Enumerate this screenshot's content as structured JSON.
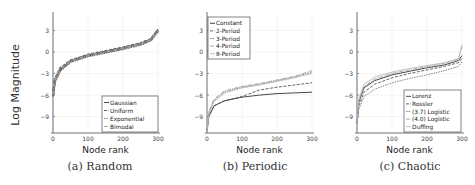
{
  "figure": {
    "ylabel": "Log Magnitude",
    "captions": [
      "(a) Random",
      "(b) Periodic",
      "(c) Chaotic"
    ]
  },
  "chart_data": [
    {
      "type": "line",
      "title": "(a) Random",
      "xlabel": "Node rank",
      "ylabel": "Log Magnitude",
      "xlim": [
        0,
        300
      ],
      "ylim": [
        -11,
        5
      ],
      "xticks": [
        0,
        100,
        200,
        300
      ],
      "yticks": [
        3,
        0,
        -3,
        -6,
        -9
      ],
      "grid": true,
      "legend_position": "lower right",
      "series": [
        {
          "name": "Gaussian",
          "x": [
            0,
            5,
            20,
            50,
            100,
            150,
            200,
            250,
            280,
            300
          ],
          "values": [
            -6,
            -4,
            -2.5,
            -1.3,
            -0.5,
            0,
            0.5,
            1.1,
            1.7,
            3
          ]
        },
        {
          "name": "Uniform",
          "x": [
            0,
            5,
            20,
            50,
            100,
            150,
            200,
            250,
            280,
            300
          ],
          "values": [
            -6,
            -3.8,
            -2.3,
            -1.2,
            -0.4,
            0.1,
            0.6,
            1.2,
            1.8,
            3.1
          ]
        },
        {
          "name": "Exponential",
          "x": [
            0,
            5,
            20,
            50,
            100,
            150,
            200,
            250,
            280,
            300
          ],
          "values": [
            -6.2,
            -4.2,
            -2.6,
            -1.4,
            -0.6,
            -0.1,
            0.4,
            1.0,
            1.6,
            2.9
          ]
        },
        {
          "name": "Bimodal",
          "x": [
            0,
            5,
            20,
            50,
            100,
            150,
            200,
            250,
            280,
            300
          ],
          "values": [
            -5.9,
            -3.9,
            -2.4,
            -1.3,
            -0.5,
            0,
            0.5,
            1.1,
            1.7,
            3
          ]
        }
      ]
    },
    {
      "type": "line",
      "title": "(b) Periodic",
      "xlabel": "Node rank",
      "ylabel": "Log Magnitude",
      "xlim": [
        0,
        300
      ],
      "ylim": [
        -11,
        5
      ],
      "xticks": [
        0,
        100,
        200,
        300
      ],
      "yticks": [
        3,
        0,
        -3,
        -6,
        -9
      ],
      "grid": true,
      "legend_position": "upper left",
      "series": [
        {
          "name": "Constant",
          "x": [
            0,
            5,
            20,
            50,
            100,
            150,
            200,
            250,
            300
          ],
          "values": [
            -11,
            -9,
            -7.5,
            -6.8,
            -6.3,
            -6,
            -5.8,
            -5.7,
            -5.6
          ]
        },
        {
          "name": "2-Period",
          "x": [
            0,
            5,
            20,
            50,
            100,
            150,
            200,
            250,
            300
          ],
          "values": [
            -11,
            -9,
            -7.5,
            -6.8,
            -6.2,
            -5.3,
            -4.9,
            -4.6,
            -4.3
          ]
        },
        {
          "name": "3-Period",
          "x": [
            0,
            5,
            20,
            50,
            100,
            150,
            200,
            250,
            300
          ],
          "values": [
            -11,
            -8.5,
            -6.8,
            -5.6,
            -4.9,
            -4.5,
            -4.0,
            -3.5,
            -2.8
          ]
        },
        {
          "name": "4-Period",
          "x": [
            0,
            5,
            20,
            50,
            100,
            150,
            200,
            250,
            300
          ],
          "values": [
            -11,
            -8.3,
            -6.6,
            -5.4,
            -4.8,
            -4.4,
            -3.9,
            -3.4,
            -2.6
          ]
        },
        {
          "name": "8-Period",
          "x": [
            0,
            5,
            20,
            50,
            100,
            150,
            200,
            250,
            300
          ],
          "values": [
            -11,
            -8.6,
            -6.9,
            -5.7,
            -5.0,
            -4.6,
            -4.1,
            -3.6,
            -3.0
          ]
        }
      ]
    },
    {
      "type": "line",
      "title": "(c) Chaotic",
      "xlabel": "Node rank",
      "ylabel": "Log Magnitude",
      "xlim": [
        0,
        300
      ],
      "ylim": [
        -11,
        5
      ],
      "xticks": [
        0,
        100,
        200,
        300
      ],
      "yticks": [
        3,
        0,
        -3,
        -6,
        -9
      ],
      "grid": true,
      "legend_position": "lower right",
      "series": [
        {
          "name": "Lorenz",
          "x": [
            0,
            5,
            20,
            50,
            100,
            150,
            200,
            250,
            290,
            300
          ],
          "values": [
            -10,
            -7,
            -5,
            -4,
            -3.2,
            -2.7,
            -2.2,
            -1.8,
            -1.2,
            -0.5
          ]
        },
        {
          "name": "Rossler",
          "x": [
            0,
            5,
            20,
            50,
            100,
            150,
            200,
            250,
            290,
            300
          ],
          "values": [
            -10,
            -7.5,
            -5.6,
            -4.5,
            -3.6,
            -3.0,
            -2.5,
            -2.0,
            -1.5,
            -0.9
          ]
        },
        {
          "name": "(3.7) Logistic",
          "x": [
            0,
            5,
            20,
            50,
            100,
            150,
            200,
            250,
            290,
            300
          ],
          "values": [
            -10,
            -8,
            -6.2,
            -5.2,
            -4.3,
            -3.7,
            -3.2,
            -2.6,
            -2.0,
            -1.4
          ]
        },
        {
          "name": "(4.0) Logistic",
          "x": [
            0,
            5,
            20,
            50,
            100,
            150,
            200,
            250,
            290,
            300
          ],
          "values": [
            -10,
            -6.8,
            -4.8,
            -3.8,
            -3.0,
            -2.5,
            -2.0,
            -1.6,
            -1.0,
            0.8
          ]
        },
        {
          "name": "Duffing",
          "x": [
            0,
            5,
            20,
            50,
            100,
            150,
            200,
            250,
            290,
            300
          ],
          "values": [
            -10,
            -6.5,
            -4.5,
            -3.5,
            -2.8,
            -2.3,
            -1.9,
            -1.5,
            -0.9,
            1.0
          ]
        }
      ]
    }
  ]
}
